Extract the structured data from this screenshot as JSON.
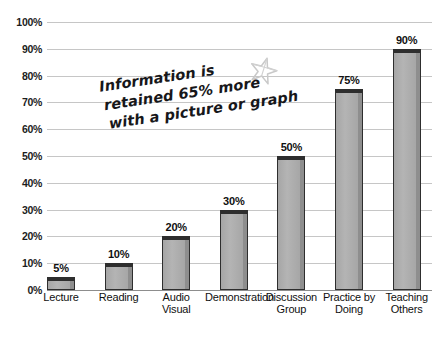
{
  "chart_data": {
    "type": "bar",
    "title": "",
    "subtitle": "",
    "xlabel": "",
    "ylabel": "",
    "ylim": [
      0,
      100
    ],
    "grid": true,
    "legend": "none",
    "orientation": "vertical",
    "categories": [
      "Lecture",
      "Reading",
      "Audio Visual",
      "Demonstration",
      "Discussion Group",
      "Practice by Doing",
      "Teaching Others"
    ],
    "category_lines": [
      [
        "Lecture"
      ],
      [
        "Reading"
      ],
      [
        "Audio Visual"
      ],
      [
        "Demonstration"
      ],
      [
        "Discussion",
        "Group"
      ],
      [
        "Practice by",
        "Doing"
      ],
      [
        "Teaching",
        "Others"
      ]
    ],
    "values": [
      5,
      10,
      20,
      30,
      50,
      75,
      90
    ],
    "value_labels": [
      "5%",
      "10%",
      "20%",
      "30%",
      "50%",
      "75%",
      "90%"
    ],
    "ytick_values": [
      100,
      90,
      80,
      70,
      60,
      50,
      40,
      30,
      20,
      10,
      0
    ],
    "ytick_labels": [
      "100%",
      "90%",
      "80%",
      "70%",
      "60%",
      "50%",
      "40%",
      "30%",
      "20%",
      "10%",
      "0%"
    ],
    "annotations": [
      {
        "name": "retention-callout",
        "lines": [
          "Information is",
          "retained 65% more",
          "with a picture or graph"
        ],
        "rotation_deg": -8.5
      }
    ],
    "colors": {
      "bar_fill": "#aeaeae",
      "bar_outline": "#2e2e2e",
      "bar_top": "#2e2e2e",
      "gridline": "#c6c6c6",
      "baseline": "#8d8d8d",
      "text": "#101010",
      "star": "#c9c9c9",
      "background": "#ffffff"
    }
  },
  "annotation": {
    "line1": "Information is",
    "line2": "retained 65% more",
    "line3": "with a picture or graph"
  },
  "icons": {
    "star": "star-icon"
  }
}
